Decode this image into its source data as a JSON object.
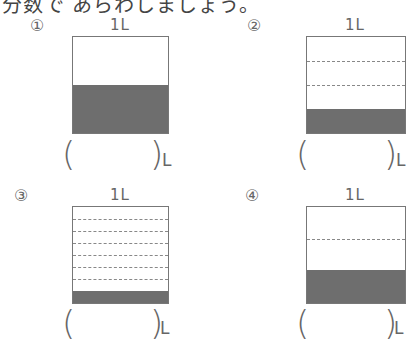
{
  "instruction": "分数で あらわしましょう。",
  "problems": [
    {
      "number": "①",
      "unit_label": "1L",
      "divisions": 2,
      "filled": 1,
      "answer": "",
      "unit": "L"
    },
    {
      "number": "②",
      "unit_label": "1L",
      "divisions": 4,
      "filled": 1,
      "answer": "",
      "unit": "L"
    },
    {
      "number": "③",
      "unit_label": "1L",
      "divisions": 8,
      "filled": 1,
      "answer": "",
      "unit": "L"
    },
    {
      "number": "④",
      "unit_label": "1L",
      "divisions": 3,
      "filled": 1,
      "answer": "",
      "unit": "L"
    }
  ],
  "colors": {
    "fill": "#6e6e6e",
    "border": "#777777",
    "dash": "#888888"
  }
}
